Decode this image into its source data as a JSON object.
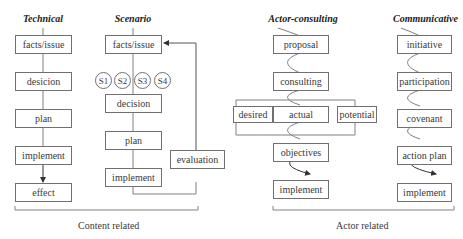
{
  "columns": {
    "technical": {
      "title": "Technical",
      "steps": [
        "facts/issue",
        "desicion",
        "plan",
        "implement",
        "effect"
      ]
    },
    "scenario": {
      "title": "Scenario",
      "steps": [
        "facts/issue",
        "decision",
        "plan",
        "implement"
      ],
      "scenarios": [
        "S1",
        "S2",
        "S3",
        "S4"
      ],
      "feedback": "evaluation"
    },
    "actor_consulting": {
      "title": "Actor-consulting",
      "steps": [
        "proposal",
        "consulting",
        "objectives",
        "implement"
      ],
      "branches": [
        "desired",
        "actual",
        "potential"
      ]
    },
    "communicative": {
      "title": "Communicative",
      "steps": [
        "initiative",
        "participation",
        "covenant",
        "action plan",
        "implement"
      ]
    }
  },
  "groups": {
    "content_related": "Content related",
    "actor_related": "Actor related"
  },
  "colors": {
    "line": "#707070",
    "text": "#3a3a3a"
  }
}
